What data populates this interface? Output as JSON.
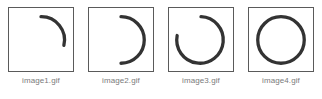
{
  "diagram": {
    "type": "animation-frame-sequence",
    "background_color": "#ffffff",
    "stroke_color": "#333333",
    "border_color": "#5a5a5a",
    "caption_color": "#7a7a7a",
    "frames": [
      {
        "caption": "image1.gif",
        "shape": "arc",
        "description": "quarter arc, upper right, open",
        "start_angle_deg": 0,
        "sweep_deg": 100,
        "path": "M 33 9 A 24 24 0 0 1 56.6 38.6"
      },
      {
        "caption": "image2.gif",
        "shape": "arc",
        "description": "half arc, right side, open left",
        "start_angle_deg": 0,
        "sweep_deg": 180,
        "path": "M 33 9 A 24 24 0 0 1 33 57"
      },
      {
        "caption": "image3.gif",
        "shape": "arc",
        "description": "three quarter arc, gap at upper left",
        "start_angle_deg": 0,
        "sweep_deg": 280,
        "path": "M 33 9 A 24 24 0 1 1 8.4 28.4"
      },
      {
        "caption": "image4.gif",
        "shape": "circle",
        "description": "complete closed circle",
        "start_angle_deg": 0,
        "sweep_deg": 360,
        "path": ""
      }
    ]
  }
}
